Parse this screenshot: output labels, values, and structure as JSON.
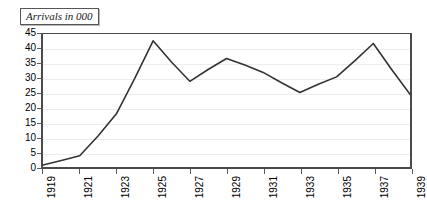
{
  "chart_data": {
    "type": "line",
    "title": "Arrivals in 000",
    "xlabel": "",
    "ylabel": "",
    "x": [
      1919,
      1920,
      1921,
      1922,
      1923,
      1924,
      1925,
      1926,
      1927,
      1928,
      1929,
      1930,
      1931,
      1932,
      1933,
      1934,
      1935,
      1936,
      1937,
      1938,
      1939
    ],
    "values": [
      0.7,
      2.2,
      3.8,
      10.5,
      18.0,
      30.0,
      42.7,
      35.5,
      29.0,
      33.0,
      36.7,
      34.5,
      32.0,
      28.5,
      25.2,
      28.0,
      30.5,
      36.0,
      41.8,
      33.0,
      24.6
    ],
    "series": [
      {
        "name": "Arrivals in 000",
        "values": [
          0.7,
          2.2,
          3.8,
          10.5,
          18.0,
          30.0,
          42.7,
          35.5,
          29.0,
          33.0,
          36.7,
          34.5,
          32.0,
          28.5,
          25.2,
          28.0,
          30.5,
          36.0,
          41.8,
          33.0,
          24.6
        ]
      }
    ],
    "xtick_labels": [
      "1919",
      "1921",
      "1923",
      "1925",
      "1927",
      "1929",
      "1931",
      "1933",
      "1935",
      "1937",
      "1939"
    ],
    "xtick_values": [
      1919,
      1921,
      1923,
      1925,
      1927,
      1929,
      1931,
      1933,
      1935,
      1937,
      1939
    ],
    "ytick_labels": [
      "45",
      "40",
      "35",
      "30",
      "25",
      "20",
      "15",
      "10",
      "5",
      "0"
    ],
    "ytick_values": [
      45,
      40,
      35,
      30,
      25,
      20,
      15,
      10,
      5,
      0
    ],
    "ylim": [
      0,
      45
    ],
    "xlim": [
      1919,
      1939
    ],
    "grid": true,
    "legend": false,
    "line_color": "#333333",
    "grid_color": "#ededed",
    "axis_color": "#4a4a4a",
    "background_color": "#ffffff"
  }
}
